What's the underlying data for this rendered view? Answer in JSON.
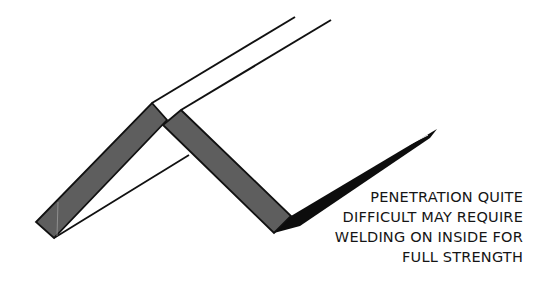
{
  "diagram": {
    "type": "weld-joint-illustration",
    "colors": {
      "background": "#ffffff",
      "plate_fill": "#5e5e5e",
      "outline": "#111111",
      "text": "#151515"
    }
  },
  "caption": {
    "lines": [
      "PENETRATION QUITE",
      "DIFFICULT MAY REQUIRE",
      "WELDING ON INSIDE FOR",
      "FULL STRENGTH"
    ]
  }
}
